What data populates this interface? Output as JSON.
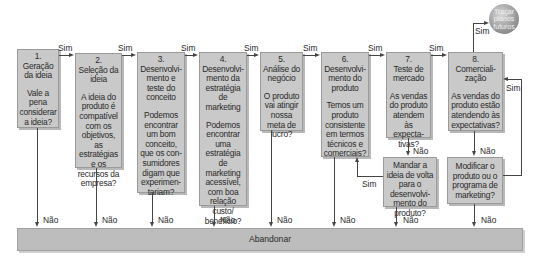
{
  "diagram": {
    "steps": [
      {
        "number": "1.",
        "title": "Geração da ideia",
        "question": "Vale a pena considerar a ideia?"
      },
      {
        "number": "2.",
        "title": "Seleção da ideia",
        "question": "A ideia do produto é compatível com os objetivos, as estratégias e os recursos da empresa?"
      },
      {
        "number": "3.",
        "title": "Desenvolvi-mento e teste do conceito",
        "question": "Podemos encontrar um bom conceito, que os con-sumidores digam que experimen-tariam?"
      },
      {
        "number": "4.",
        "title": "Desenvolvi-mento da estratégia de marketing",
        "question": "Podemos encontrar uma estratégia de marketing acessível, com boa relação custo/ benefício?"
      },
      {
        "number": "5.",
        "title": "Análise do negócio",
        "question": "O produto vai atingir nossa meta de lucro?"
      },
      {
        "number": "6.",
        "title": "Desenvolvi-mento do produto",
        "question": "Temos um produto consistente em termos técnicos e comerciais?"
      },
      {
        "number": "7.",
        "title": "Teste de mercado",
        "question": "As vendas do produto atendem às expecta-tivas?"
      },
      {
        "number": "8.",
        "title": "Comerciali-zação",
        "question": "As vendas do produto estão atendendo às expectativas?"
      }
    ],
    "side_questions": {
      "send_back": "Mandar a ideia de volta para o desenvolvi-mento do produto?",
      "modify": "Modificar o produto ou o programa de marketing?"
    },
    "yes_label": "Sim",
    "no_label": "Não",
    "abandon_label": "Abandonar",
    "future_plans_label": "Traçar planos futuros"
  }
}
